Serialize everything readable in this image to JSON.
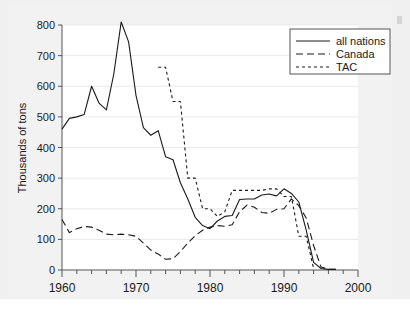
{
  "figure": {
    "background_color": "#f0f0f0",
    "plot_background_color": "#ffffff",
    "axis_color": "#555555",
    "grid_color": "#e9e9e9",
    "line_color": "#1a1a1a"
  },
  "chart_data": {
    "type": "line",
    "title": "",
    "xlabel": "",
    "ylabel": "Thousands of tons",
    "xlim": [
      1960,
      2000
    ],
    "ylim": [
      0,
      800
    ],
    "xticks": [
      1960,
      1970,
      1980,
      1990,
      2000
    ],
    "xtick_labels": [
      "1960",
      "1970",
      "1980",
      "1990",
      "2000"
    ],
    "x_minor_tick_step": 2,
    "yticks": [
      0,
      100,
      200,
      300,
      400,
      500,
      600,
      700,
      800
    ],
    "ytick_labels": [
      "0",
      "100",
      "200",
      "300",
      "400",
      "500",
      "600",
      "700",
      "800"
    ],
    "grid": "horizontal-faint",
    "legend_position": "top-right",
    "legend_entries": [
      {
        "label": "all nations",
        "style": "solid"
      },
      {
        "label": "Canada",
        "style": "long-dash"
      },
      {
        "label": "TAC",
        "style": "short-dash"
      }
    ],
    "series": [
      {
        "name": "all nations",
        "style": "solid",
        "x": [
          1960,
          1961,
          1962,
          1963,
          1964,
          1965,
          1966,
          1967,
          1968,
          1969,
          1970,
          1971,
          1972,
          1973,
          1974,
          1975,
          1976,
          1977,
          1978,
          1979,
          1980,
          1981,
          1982,
          1983,
          1984,
          1985,
          1986,
          1987,
          1988,
          1989,
          1990,
          1991,
          1992,
          1993,
          1994,
          1995,
          1996,
          1997
        ],
        "y": [
          460,
          495,
          500,
          508,
          600,
          545,
          523,
          640,
          810,
          745,
          570,
          465,
          440,
          455,
          370,
          360,
          285,
          232,
          172,
          145,
          135,
          160,
          175,
          178,
          230,
          232,
          232,
          245,
          248,
          242,
          265,
          250,
          222,
          130,
          25,
          5,
          2,
          2
        ]
      },
      {
        "name": "Canada",
        "style": "long-dash",
        "x": [
          1960,
          1961,
          1962,
          1963,
          1964,
          1965,
          1966,
          1967,
          1968,
          1969,
          1970,
          1971,
          1972,
          1973,
          1974,
          1975,
          1976,
          1977,
          1978,
          1979,
          1980,
          1981,
          1982,
          1983,
          1984,
          1985,
          1986,
          1987,
          1988,
          1989,
          1990,
          1991,
          1992,
          1993,
          1994,
          1995,
          1996,
          1997
        ],
        "y": [
          165,
          122,
          135,
          142,
          140,
          130,
          117,
          115,
          117,
          115,
          110,
          88,
          65,
          52,
          35,
          37,
          60,
          88,
          112,
          130,
          140,
          145,
          143,
          148,
          190,
          212,
          205,
          188,
          185,
          198,
          200,
          232,
          210,
          170,
          80,
          10,
          2,
          2
        ]
      },
      {
        "name": "TAC",
        "style": "short-dash",
        "x": [
          1973,
          1974,
          1975,
          1976,
          1977,
          1978,
          1979,
          1980,
          1981,
          1982,
          1983,
          1984,
          1985,
          1986,
          1987,
          1988,
          1989,
          1990,
          1991,
          1992,
          1993,
          1994
        ],
        "y": [
          662,
          662,
          550,
          550,
          300,
          300,
          200,
          200,
          175,
          190,
          260,
          260,
          260,
          260,
          260,
          265,
          265,
          240,
          240,
          110,
          110,
          5
        ]
      }
    ]
  }
}
